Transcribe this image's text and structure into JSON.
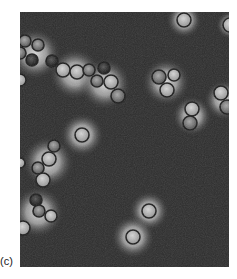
{
  "figure": {
    "panel_label": "(c)",
    "image_description": "Phase-contrast micrograph of spherical cells (cocci) in chains and clusters with bright halos on a dark background",
    "colors": {
      "background": "#2c2c2c",
      "halo": "#d8d8d8",
      "cell_rim": "#1a1a1a",
      "cell_interior": "#9a9a9a"
    },
    "cells": [
      {
        "x": 164,
        "y": 8,
        "r": 7,
        "tone": "light"
      },
      {
        "x": 210,
        "y": 13,
        "r": 7,
        "tone": "light"
      },
      {
        "x": 5,
        "y": 29,
        "r": 6,
        "tone": "mid"
      },
      {
        "x": 18,
        "y": 33,
        "r": 6,
        "tone": "mid"
      },
      {
        "x": 0,
        "y": 41,
        "r": 6,
        "tone": "mid"
      },
      {
        "x": 12,
        "y": 48,
        "r": 6,
        "tone": "dark"
      },
      {
        "x": 32,
        "y": 49,
        "r": 6,
        "tone": "dark"
      },
      {
        "x": 43,
        "y": 58,
        "r": 7,
        "tone": "light"
      },
      {
        "x": 57,
        "y": 60,
        "r": 7,
        "tone": "light"
      },
      {
        "x": 69,
        "y": 58,
        "r": 6,
        "tone": "mid"
      },
      {
        "x": 84,
        "y": 56,
        "r": 6,
        "tone": "dark"
      },
      {
        "x": 77,
        "y": 69,
        "r": 6,
        "tone": "mid"
      },
      {
        "x": 91,
        "y": 70,
        "r": 7,
        "tone": "light"
      },
      {
        "x": 98,
        "y": 84,
        "r": 7,
        "tone": "mid"
      },
      {
        "x": 0,
        "y": 68,
        "r": 6,
        "tone": "light"
      },
      {
        "x": 139,
        "y": 65,
        "r": 7,
        "tone": "mid"
      },
      {
        "x": 154,
        "y": 63,
        "r": 6,
        "tone": "light"
      },
      {
        "x": 147,
        "y": 78,
        "r": 7,
        "tone": "light"
      },
      {
        "x": 201,
        "y": 81,
        "r": 7,
        "tone": "light"
      },
      {
        "x": 207,
        "y": 95,
        "r": 7,
        "tone": "mid"
      },
      {
        "x": 172,
        "y": 97,
        "r": 7,
        "tone": "light"
      },
      {
        "x": 170,
        "y": 111,
        "r": 7,
        "tone": "mid"
      },
      {
        "x": 62,
        "y": 123,
        "r": 7,
        "tone": "light"
      },
      {
        "x": 34,
        "y": 134,
        "r": 6,
        "tone": "mid"
      },
      {
        "x": 29,
        "y": 147,
        "r": 7,
        "tone": "light"
      },
      {
        "x": 18,
        "y": 156,
        "r": 6,
        "tone": "mid"
      },
      {
        "x": 23,
        "y": 168,
        "r": 7,
        "tone": "light"
      },
      {
        "x": 0,
        "y": 151,
        "r": 5,
        "tone": "light"
      },
      {
        "x": 16,
        "y": 188,
        "r": 6,
        "tone": "dark"
      },
      {
        "x": 19,
        "y": 199,
        "r": 6,
        "tone": "mid"
      },
      {
        "x": 31,
        "y": 204,
        "r": 6,
        "tone": "light"
      },
      {
        "x": 3,
        "y": 216,
        "r": 7,
        "tone": "light"
      },
      {
        "x": 129,
        "y": 199,
        "r": 7,
        "tone": "light"
      },
      {
        "x": 113,
        "y": 225,
        "r": 7,
        "tone": "light"
      }
    ],
    "halos": [
      {
        "x": 164,
        "y": 8,
        "r": 18
      },
      {
        "x": 210,
        "y": 13,
        "r": 14
      },
      {
        "x": 15,
        "y": 42,
        "r": 26
      },
      {
        "x": 55,
        "y": 62,
        "r": 26
      },
      {
        "x": 85,
        "y": 72,
        "r": 26
      },
      {
        "x": 146,
        "y": 70,
        "r": 24
      },
      {
        "x": 204,
        "y": 88,
        "r": 20
      },
      {
        "x": 172,
        "y": 104,
        "r": 20
      },
      {
        "x": 62,
        "y": 123,
        "r": 22
      },
      {
        "x": 28,
        "y": 150,
        "r": 26
      },
      {
        "x": 18,
        "y": 200,
        "r": 26
      },
      {
        "x": 129,
        "y": 199,
        "r": 20
      },
      {
        "x": 113,
        "y": 225,
        "r": 22
      }
    ]
  }
}
